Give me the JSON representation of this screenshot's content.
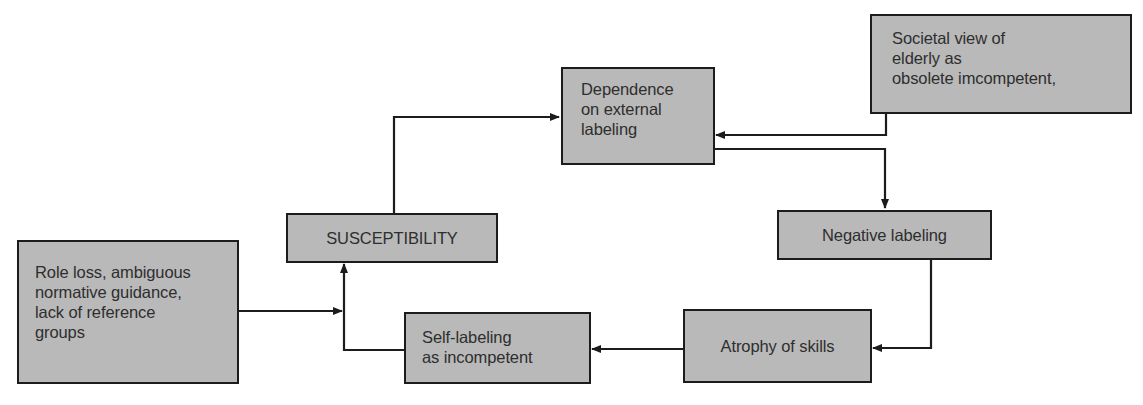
{
  "diagram": {
    "nodes": {
      "societal_view": {
        "label": "Societal view of\nelderly as\nobsolete imcompetent,"
      },
      "dependence": {
        "label": "Dependence\non external\nlabeling"
      },
      "negative_labeling": {
        "label": "Negative labeling"
      },
      "atrophy": {
        "label": "Atrophy of skills"
      },
      "self_labeling": {
        "label": "Self-labeling\nas incompetent"
      },
      "susceptibility": {
        "label": "SUSCEPTIBILITY"
      },
      "role_loss": {
        "label": "Role loss, ambiguous\nnormative guidance,\nlack of reference\ngroups"
      }
    },
    "edges": [
      {
        "from": "role_loss",
        "to": "susceptibility"
      },
      {
        "from": "susceptibility",
        "to": "dependence"
      },
      {
        "from": "societal_view",
        "to": "dependence"
      },
      {
        "from": "dependence",
        "to": "negative_labeling"
      },
      {
        "from": "negative_labeling",
        "to": "atrophy"
      },
      {
        "from": "atrophy",
        "to": "self_labeling"
      },
      {
        "from": "self_labeling",
        "to": "susceptibility"
      }
    ],
    "colors": {
      "box_fill": "#b9b9b9",
      "line": "#1c1c1c",
      "text": "#2e2e2e"
    }
  }
}
